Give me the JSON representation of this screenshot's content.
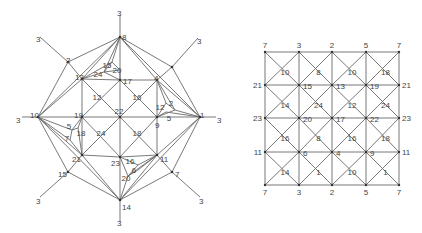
{
  "figure": {
    "left_diagram": {
      "title": "",
      "vertices": [
        {
          "id": "v8",
          "label": "8",
          "x": 120,
          "y": 37,
          "lx": 122,
          "ly": 37
        },
        {
          "id": "v3t",
          "label": "3",
          "x": 120,
          "y": 15,
          "lx": 117,
          "ly": 13
        },
        {
          "id": "v13",
          "label": "13",
          "x": 82,
          "y": 79,
          "lx": 75,
          "ly": 77
        },
        {
          "id": "v17",
          "label": "17",
          "x": 120,
          "y": 80,
          "lx": 123,
          "ly": 81
        },
        {
          "id": "v4",
          "label": "4",
          "x": 157,
          "y": 80,
          "lx": 154,
          "ly": 78
        },
        {
          "id": "v10",
          "label": "10",
          "x": 38,
          "y": 117,
          "lx": 30,
          "ly": 115
        },
        {
          "id": "v19",
          "label": "19",
          "x": 82,
          "y": 117,
          "lx": 74,
          "ly": 115
        },
        {
          "id": "vc",
          "label": "",
          "x": 120,
          "y": 117,
          "lx": 0,
          "ly": 0
        },
        {
          "id": "v9",
          "label": "9",
          "x": 157,
          "y": 117,
          "lx": 155,
          "ly": 125
        },
        {
          "id": "v1",
          "label": "1",
          "x": 200,
          "y": 117,
          "lx": 200,
          "ly": 115
        },
        {
          "id": "v21",
          "label": "21",
          "x": 82,
          "y": 155,
          "lx": 72,
          "ly": 159
        },
        {
          "id": "v23",
          "label": "23",
          "x": 120,
          "y": 157,
          "lx": 111,
          "ly": 163
        },
        {
          "id": "v11",
          "label": "11",
          "x": 157,
          "y": 155,
          "lx": 160,
          "ly": 159
        },
        {
          "id": "v14",
          "label": "14",
          "x": 120,
          "y": 200,
          "lx": 122,
          "ly": 207
        },
        {
          "id": "v3b",
          "label": "3",
          "x": 120,
          "y": 222,
          "lx": 117,
          "ly": 223
        },
        {
          "id": "v2",
          "label": "2",
          "x": 68,
          "y": 62,
          "lx": 66,
          "ly": 60
        },
        {
          "id": "v15",
          "label": "15",
          "x": 68,
          "y": 172,
          "lx": 58,
          "ly": 174
        },
        {
          "id": "v7",
          "label": "7",
          "x": 172,
          "y": 172,
          "lx": 175,
          "ly": 174
        },
        {
          "id": "vne",
          "label": "",
          "x": 172,
          "y": 67,
          "lx": 0,
          "ly": 0
        },
        {
          "id": "v3nw",
          "label": "3",
          "x": 40,
          "y": 37,
          "lx": 36,
          "ly": 39
        },
        {
          "id": "v3ne",
          "label": "3",
          "x": 198,
          "y": 38,
          "lx": 197,
          "ly": 41
        },
        {
          "id": "v3w",
          "label": "3",
          "x": 22,
          "y": 117,
          "lx": 16,
          "ly": 120
        },
        {
          "id": "v3e",
          "label": "3",
          "x": 216,
          "y": 117,
          "lx": 217,
          "ly": 120
        },
        {
          "id": "v3sw",
          "label": "3",
          "x": 40,
          "y": 197,
          "lx": 36,
          "ly": 201
        },
        {
          "id": "v3se",
          "label": "3",
          "x": 200,
          "y": 197,
          "lx": 199,
          "ly": 201
        }
      ],
      "face_labels": [
        {
          "label": "15",
          "x": 107,
          "y": 65
        },
        {
          "label": "20",
          "x": 117,
          "y": 70
        },
        {
          "label": "24",
          "x": 98,
          "y": 74
        },
        {
          "label": "12",
          "x": 97,
          "y": 97
        },
        {
          "label": "16",
          "x": 137,
          "y": 97
        },
        {
          "label": "22",
          "x": 119,
          "y": 111
        },
        {
          "label": "12",
          "x": 160,
          "y": 107
        },
        {
          "label": "2",
          "x": 171,
          "y": 103
        },
        {
          "label": "5",
          "x": 169,
          "y": 118
        },
        {
          "label": "5",
          "x": 69,
          "y": 126
        },
        {
          "label": "18",
          "x": 81,
          "y": 133
        },
        {
          "label": "7",
          "x": 67,
          "y": 138
        },
        {
          "label": "24",
          "x": 101,
          "y": 133
        },
        {
          "label": "18",
          "x": 137,
          "y": 133
        },
        {
          "label": "16",
          "x": 130,
          "y": 161
        },
        {
          "label": "6",
          "x": 134,
          "y": 170
        },
        {
          "label": "20",
          "x": 126,
          "y": 178
        }
      ]
    },
    "right_diagram": {
      "columns_x": [
        265,
        299,
        332,
        366,
        399
      ],
      "rows_y": [
        52,
        85,
        118,
        152,
        185
      ],
      "top_labels": [
        "7",
        "3",
        "2",
        "5",
        "7"
      ],
      "bottom_labels": [
        "7",
        "3",
        "2",
        "5",
        "7"
      ],
      "left_labels": [
        "21",
        "23",
        "11"
      ],
      "right_labels": [
        "21",
        "23",
        "11"
      ],
      "cell_center_labels": [
        [
          "10",
          "8",
          "10",
          "18"
        ],
        [
          "14",
          "24",
          "12",
          "24"
        ],
        [
          "16",
          "8",
          "16",
          "18"
        ],
        [
          "14",
          "1",
          "10",
          "1"
        ]
      ],
      "interior_vertex_labels": [
        [
          "15",
          "13",
          "19"
        ],
        [
          "20",
          "17",
          "22"
        ],
        [
          "6",
          "4",
          "9"
        ]
      ]
    }
  }
}
